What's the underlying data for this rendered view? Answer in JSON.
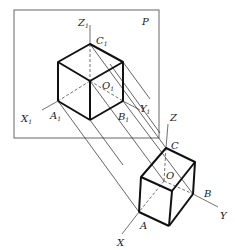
{
  "diagram": {
    "plane_label": "P",
    "projected_labels": {
      "z1": "Z",
      "z1_sub": "1",
      "c1": "C",
      "c1_sub": "1",
      "o1": "O",
      "o1_sub": "1",
      "y1": "Y",
      "y1_sub": "1",
      "x1": "X",
      "x1_sub": "1",
      "a1": "A",
      "a1_sub": "1",
      "b1": "B",
      "b1_sub": "1"
    },
    "object_labels": {
      "z": "Z",
      "c": "C",
      "o": "O",
      "b": "B",
      "y": "Y",
      "x": "X",
      "a": "A"
    },
    "colors": {
      "stroke": "#111111",
      "plane_border": "#555555",
      "background": "#ffffff"
    }
  }
}
